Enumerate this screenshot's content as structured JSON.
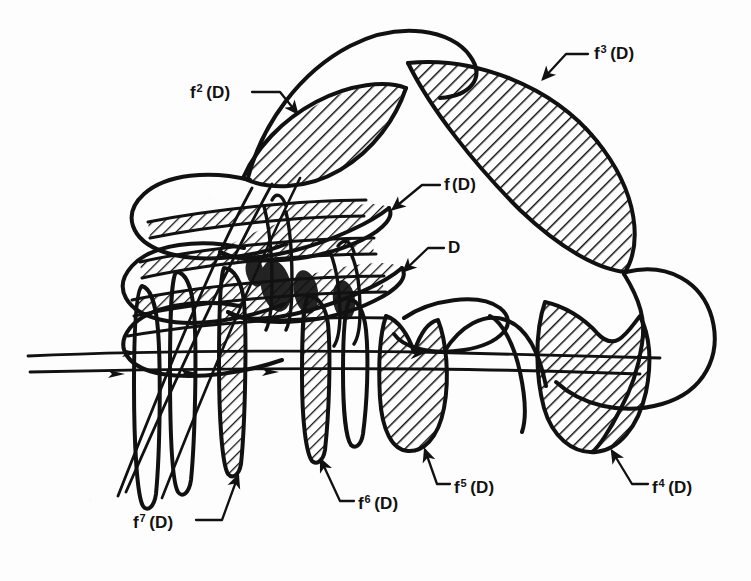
{
  "figure": {
    "background_color": "#fdfdfd",
    "ink_color": "#111111",
    "hatch_color": "#111111",
    "stroke_width_outline": 4.0,
    "stroke_width_manifold": 2.6,
    "hatch_spacing_px": 9,
    "hatch_angle_deg": 45
  },
  "labels": [
    {
      "id": "label-f3",
      "name": "label-f3-d",
      "base": "f",
      "superscript": "3",
      "argument": "(D)",
      "x": 594,
      "y": 44,
      "leader": {
        "from_x": 588,
        "from_y": 54,
        "elbow_x": 566,
        "elbow_y": 54,
        "to_x": 543,
        "to_y": 79,
        "arrow": true
      }
    },
    {
      "id": "label-f2",
      "name": "label-f2-d",
      "base": "f",
      "superscript": "2",
      "argument": "(D)",
      "x": 190,
      "y": 83,
      "leader": {
        "from_x": 252,
        "from_y": 92,
        "elbow_x": 280,
        "elbow_y": 92,
        "to_x": 297,
        "to_y": 113,
        "arrow": true
      }
    },
    {
      "id": "label-f",
      "name": "label-f-d",
      "base": "f",
      "superscript": "",
      "argument": "(D)",
      "x": 444,
      "y": 176,
      "leader": {
        "from_x": 440,
        "from_y": 185,
        "elbow_x": 422,
        "elbow_y": 185,
        "to_x": 393,
        "to_y": 209,
        "arrow": true
      }
    },
    {
      "id": "label-D",
      "name": "label-d",
      "base": "D",
      "superscript": "",
      "argument": "",
      "x": 448,
      "y": 239,
      "leader": {
        "from_x": 444,
        "from_y": 248,
        "elbow_x": 428,
        "elbow_y": 248,
        "to_x": 404,
        "to_y": 271,
        "arrow": true
      }
    },
    {
      "id": "label-f7",
      "name": "label-f7-d",
      "base": "f",
      "superscript": "7",
      "argument": "(D)",
      "x": 133,
      "y": 513,
      "leader": {
        "from_x": 196,
        "from_y": 520,
        "elbow_x": 222,
        "elbow_y": 520,
        "to_x": 238,
        "to_y": 476,
        "arrow": true
      }
    },
    {
      "id": "label-f6",
      "name": "label-f6-d",
      "base": "f",
      "superscript": "6",
      "argument": "(D)",
      "x": 358,
      "y": 494,
      "leader": {
        "from_x": 354,
        "from_y": 501,
        "elbow_x": 340,
        "elbow_y": 501,
        "to_x": 321,
        "to_y": 460,
        "arrow": true
      }
    },
    {
      "id": "label-f5",
      "name": "label-f5-d",
      "base": "f",
      "superscript": "5",
      "argument": "(D)",
      "x": 454,
      "y": 478,
      "leader": {
        "from_x": 450,
        "from_y": 484,
        "elbow_x": 437,
        "elbow_y": 484,
        "to_x": 425,
        "to_y": 450,
        "arrow": true
      }
    },
    {
      "id": "label-f4",
      "name": "label-f4-d",
      "base": "f",
      "superscript": "4",
      "argument": "(D)",
      "x": 652,
      "y": 478,
      "leader": {
        "from_x": 648,
        "from_y": 484,
        "elbow_x": 632,
        "elbow_y": 484,
        "to_x": 612,
        "to_y": 451,
        "arrow": true
      }
    }
  ],
  "regions": [
    {
      "name": "region-f3-d",
      "label_ref": "label-f3",
      "fill": "hatched",
      "description": "large lens-shaped lobe, upper right"
    },
    {
      "name": "region-f2-d",
      "label_ref": "label-f2",
      "fill": "hatched",
      "description": "crescent lobe, upper left"
    },
    {
      "name": "region-f-d",
      "label_ref": "label-f",
      "fill": "hatched",
      "description": "elongated sliver pointing upper-right, center"
    },
    {
      "name": "region-d",
      "label_ref": "label-D",
      "fill": "hatched",
      "description": "elongated sliver pointing upper-right, below f(D)"
    },
    {
      "name": "region-f4-d",
      "label_ref": "label-f4",
      "fill": "hatched",
      "description": "broad lobe, lower right"
    },
    {
      "name": "region-f5-d",
      "label_ref": "label-f5",
      "fill": "hatched",
      "description": "rounded lobe, lower center-right"
    },
    {
      "name": "region-f6-d",
      "label_ref": "label-f6",
      "fill": "hatched",
      "description": "narrow vertical finger, lower center"
    },
    {
      "name": "region-f7-d",
      "label_ref": "label-f7",
      "fill": "hatched",
      "description": "narrow vertical finger, lower left"
    }
  ],
  "manifolds": {
    "name": "invariant-manifold-curves",
    "arrow_markers": 3,
    "description": "Two nearly horizontal stable-manifold strands entering from the left with direction arrowheads, folding into the tangle."
  }
}
